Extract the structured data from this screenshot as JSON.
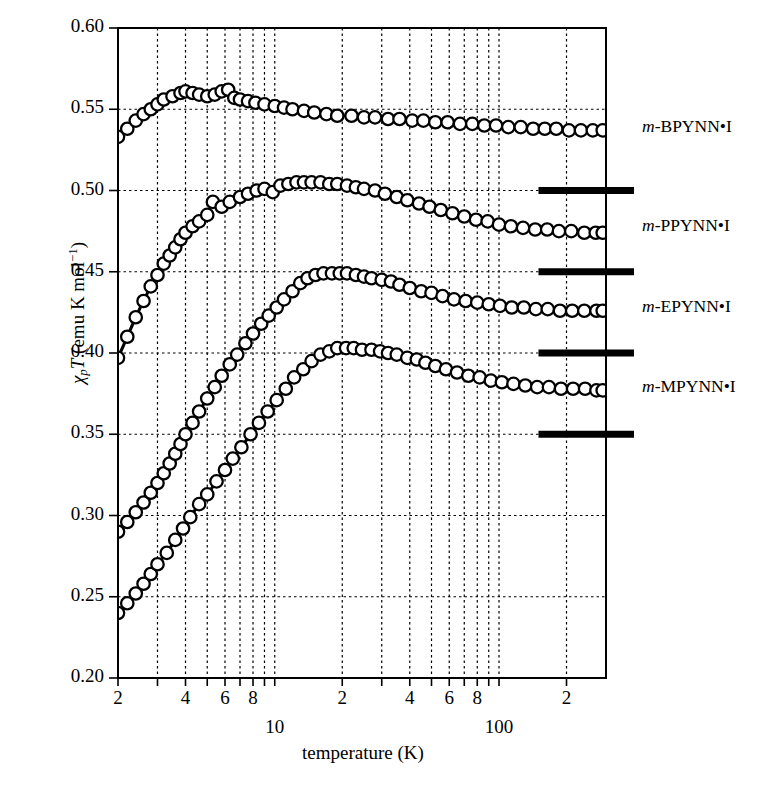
{
  "figure": {
    "background": "#ffffff",
    "ink": "#000000"
  },
  "axes": {
    "x": {
      "title": "temperature (K)",
      "scale": "log",
      "min": 2,
      "max": 300,
      "major_decade_labels": [
        {
          "value": 10,
          "text": "10"
        },
        {
          "value": 100,
          "text": "100"
        }
      ],
      "tick_labels": [
        {
          "value": 2,
          "text": "2"
        },
        {
          "value": 4,
          "text": "4"
        },
        {
          "value": 6,
          "text": "6"
        },
        {
          "value": 8,
          "text": "8"
        },
        {
          "value": 20,
          "text": "2"
        },
        {
          "value": 40,
          "text": "4"
        },
        {
          "value": 60,
          "text": "6"
        },
        {
          "value": 80,
          "text": "8"
        },
        {
          "value": 200,
          "text": "2"
        }
      ],
      "gridlines": [
        3,
        4,
        5,
        6,
        7,
        8,
        9,
        10,
        20,
        30,
        40,
        50,
        60,
        70,
        80,
        90,
        100,
        200
      ],
      "grid": true
    },
    "y": {
      "title_plain": "χpT (emu K mol⁻¹)",
      "title_parts": {
        "chi": "χ",
        "sub": "p",
        "T": "T",
        "unit_open": " (emu K mol",
        "unit_exp": "−1",
        "unit_close": ")"
      },
      "scale": "linear",
      "min": 0.2,
      "max": 0.6,
      "tick_labels": [
        "0.60",
        "0.55",
        "0.50",
        "0.45",
        "0.40",
        "0.35",
        "0.30",
        "0.25",
        "0.20"
      ],
      "tick_values": [
        0.6,
        0.55,
        0.5,
        0.45,
        0.4,
        0.35,
        0.3,
        0.25,
        0.2
      ],
      "gridlines": [
        0.55,
        0.5,
        0.45,
        0.4,
        0.35,
        0.3,
        0.25
      ],
      "grid": true
    }
  },
  "series_labels": [
    {
      "prefix": "m",
      "name": "-BPYNN•I"
    },
    {
      "prefix": "m",
      "name": "-PPYNN•I"
    },
    {
      "prefix": "m",
      "name": "-EPYNN•I"
    },
    {
      "prefix": "m",
      "name": "-MPYNN•I"
    }
  ],
  "reference_bars": [
    {
      "value": 0.5,
      "label": "0.50"
    },
    {
      "value": 0.45,
      "label": "0.45"
    },
    {
      "value": 0.4,
      "label": "0.40"
    },
    {
      "value": 0.35,
      "label": "0.35"
    }
  ],
  "chart_data": {
    "type": "scatter",
    "title": "",
    "xlabel": "temperature (K)",
    "ylabel": "χpT (emu K mol⁻¹)",
    "xscale": "log",
    "xlim": [
      2,
      300
    ],
    "ylim": [
      0.2,
      0.6
    ],
    "grid": true,
    "legend": "right-side inline annotations",
    "marker": "open-circle",
    "series": [
      {
        "name": "m-BPYNN•I",
        "peak": {
          "T": 4.0,
          "value": 0.561
        },
        "points": [
          [
            2.0,
            0.533
          ],
          [
            2.2,
            0.538
          ],
          [
            2.4,
            0.543
          ],
          [
            2.6,
            0.547
          ],
          [
            2.8,
            0.55
          ],
          [
            3.0,
            0.553
          ],
          [
            3.2,
            0.556
          ],
          [
            3.5,
            0.558
          ],
          [
            3.8,
            0.56
          ],
          [
            4.0,
            0.561
          ],
          [
            4.3,
            0.56
          ],
          [
            4.6,
            0.559
          ],
          [
            5.0,
            0.558
          ],
          [
            5.4,
            0.559
          ],
          [
            5.8,
            0.561
          ],
          [
            6.2,
            0.562
          ],
          [
            6.6,
            0.557
          ],
          [
            7.0,
            0.556
          ],
          [
            7.6,
            0.555
          ],
          [
            8.2,
            0.554
          ],
          [
            9.0,
            0.553
          ],
          [
            10.0,
            0.552
          ],
          [
            11.0,
            0.551
          ],
          [
            12.0,
            0.55
          ],
          [
            13.5,
            0.549
          ],
          [
            15.0,
            0.548
          ],
          [
            17.0,
            0.547
          ],
          [
            19.0,
            0.546
          ],
          [
            22.0,
            0.546
          ],
          [
            25.0,
            0.545
          ],
          [
            28.0,
            0.545
          ],
          [
            32.0,
            0.544
          ],
          [
            36.0,
            0.544
          ],
          [
            41.0,
            0.543
          ],
          [
            46.0,
            0.543
          ],
          [
            52.0,
            0.542
          ],
          [
            59.0,
            0.542
          ],
          [
            67.0,
            0.541
          ],
          [
            76.0,
            0.541
          ],
          [
            86.0,
            0.54
          ],
          [
            97.0,
            0.54
          ],
          [
            110.0,
            0.539
          ],
          [
            125.0,
            0.539
          ],
          [
            142.0,
            0.538
          ],
          [
            160.0,
            0.538
          ],
          [
            180.0,
            0.538
          ],
          [
            205.0,
            0.537
          ],
          [
            232.0,
            0.537
          ],
          [
            262.0,
            0.537
          ],
          [
            290.0,
            0.537
          ]
        ],
        "fit_line": true
      },
      {
        "name": "m-PPYNN•I",
        "peak": {
          "T": 13.0,
          "value": 0.505
        },
        "points": [
          [
            2.0,
            0.397
          ],
          [
            2.2,
            0.41
          ],
          [
            2.4,
            0.422
          ],
          [
            2.6,
            0.432
          ],
          [
            2.8,
            0.441
          ],
          [
            3.0,
            0.448
          ],
          [
            3.2,
            0.455
          ],
          [
            3.4,
            0.46
          ],
          [
            3.6,
            0.465
          ],
          [
            3.8,
            0.47
          ],
          [
            4.0,
            0.474
          ],
          [
            4.3,
            0.478
          ],
          [
            4.6,
            0.481
          ],
          [
            5.0,
            0.485
          ],
          [
            5.3,
            0.493
          ],
          [
            5.8,
            0.49
          ],
          [
            6.3,
            0.493
          ],
          [
            7.0,
            0.496
          ],
          [
            7.6,
            0.498
          ],
          [
            8.3,
            0.5
          ],
          [
            9.0,
            0.501
          ],
          [
            9.8,
            0.499
          ],
          [
            10.6,
            0.503
          ],
          [
            11.5,
            0.504
          ],
          [
            12.5,
            0.505
          ],
          [
            13.5,
            0.505
          ],
          [
            14.6,
            0.505
          ],
          [
            16.0,
            0.505
          ],
          [
            17.5,
            0.504
          ],
          [
            19.0,
            0.504
          ],
          [
            21.0,
            0.503
          ],
          [
            23.0,
            0.502
          ],
          [
            25.0,
            0.501
          ],
          [
            28.0,
            0.5
          ],
          [
            31.0,
            0.498
          ],
          [
            35.0,
            0.496
          ],
          [
            39.0,
            0.494
          ],
          [
            44.0,
            0.492
          ],
          [
            49.0,
            0.49
          ],
          [
            55.0,
            0.488
          ],
          [
            62.0,
            0.486
          ],
          [
            70.0,
            0.484
          ],
          [
            79.0,
            0.482
          ],
          [
            89.0,
            0.481
          ],
          [
            100.0,
            0.479
          ],
          [
            113.0,
            0.478
          ],
          [
            128.0,
            0.477
          ],
          [
            145.0,
            0.476
          ],
          [
            164.0,
            0.476
          ],
          [
            185.0,
            0.475
          ],
          [
            210.0,
            0.475
          ],
          [
            240.0,
            0.474
          ],
          [
            270.0,
            0.474
          ],
          [
            290.0,
            0.474
          ]
        ],
        "fit_line": true
      },
      {
        "name": "m-EPYNN•I",
        "peak": {
          "T": 14.0,
          "value": 0.449
        },
        "points": [
          [
            2.0,
            0.29
          ],
          [
            2.2,
            0.296
          ],
          [
            2.4,
            0.302
          ],
          [
            2.6,
            0.308
          ],
          [
            2.8,
            0.314
          ],
          [
            3.0,
            0.32
          ],
          [
            3.2,
            0.326
          ],
          [
            3.4,
            0.332
          ],
          [
            3.6,
            0.338
          ],
          [
            3.8,
            0.344
          ],
          [
            4.0,
            0.35
          ],
          [
            4.3,
            0.357
          ],
          [
            4.6,
            0.364
          ],
          [
            5.0,
            0.372
          ],
          [
            5.4,
            0.379
          ],
          [
            5.8,
            0.386
          ],
          [
            6.3,
            0.393
          ],
          [
            6.8,
            0.399
          ],
          [
            7.4,
            0.406
          ],
          [
            8.0,
            0.412
          ],
          [
            8.7,
            0.418
          ],
          [
            9.4,
            0.423
          ],
          [
            10.2,
            0.428
          ],
          [
            11.0,
            0.433
          ],
          [
            12.0,
            0.438
          ],
          [
            13.0,
            0.443
          ],
          [
            14.0,
            0.446
          ],
          [
            15.2,
            0.448
          ],
          [
            16.5,
            0.449
          ],
          [
            18.0,
            0.449
          ],
          [
            19.5,
            0.449
          ],
          [
            21.0,
            0.449
          ],
          [
            23.0,
            0.448
          ],
          [
            25.0,
            0.447
          ],
          [
            27.0,
            0.446
          ],
          [
            30.0,
            0.445
          ],
          [
            33.0,
            0.444
          ],
          [
            36.0,
            0.442
          ],
          [
            40.0,
            0.44
          ],
          [
            45.0,
            0.438
          ],
          [
            50.0,
            0.437
          ],
          [
            56.0,
            0.435
          ],
          [
            63.0,
            0.433
          ],
          [
            71.0,
            0.432
          ],
          [
            80.0,
            0.431
          ],
          [
            90.0,
            0.43
          ],
          [
            101.0,
            0.429
          ],
          [
            114.0,
            0.428
          ],
          [
            129.0,
            0.428
          ],
          [
            146.0,
            0.427
          ],
          [
            165.0,
            0.427
          ],
          [
            187.0,
            0.426
          ],
          [
            212.0,
            0.426
          ],
          [
            240.0,
            0.426
          ],
          [
            272.0,
            0.426
          ],
          [
            290.0,
            0.426
          ]
        ],
        "fit_line": true
      },
      {
        "name": "m-MPYNN•I",
        "peak": {
          "T": 19.0,
          "value": 0.403
        },
        "points": [
          [
            2.0,
            0.24
          ],
          [
            2.2,
            0.246
          ],
          [
            2.4,
            0.252
          ],
          [
            2.6,
            0.258
          ],
          [
            2.8,
            0.264
          ],
          [
            3.0,
            0.27
          ],
          [
            3.3,
            0.277
          ],
          [
            3.6,
            0.285
          ],
          [
            3.9,
            0.292
          ],
          [
            4.2,
            0.299
          ],
          [
            4.6,
            0.307
          ],
          [
            5.0,
            0.313
          ],
          [
            5.5,
            0.321
          ],
          [
            6.0,
            0.328
          ],
          [
            6.5,
            0.335
          ],
          [
            7.1,
            0.342
          ],
          [
            7.8,
            0.35
          ],
          [
            8.5,
            0.357
          ],
          [
            9.3,
            0.364
          ],
          [
            10.2,
            0.371
          ],
          [
            11.2,
            0.378
          ],
          [
            12.2,
            0.385
          ],
          [
            13.4,
            0.39
          ],
          [
            14.6,
            0.395
          ],
          [
            16.0,
            0.399
          ],
          [
            17.5,
            0.401
          ],
          [
            19.0,
            0.403
          ],
          [
            20.8,
            0.403
          ],
          [
            22.5,
            0.403
          ],
          [
            24.5,
            0.402
          ],
          [
            27.0,
            0.402
          ],
          [
            29.5,
            0.401
          ],
          [
            32.0,
            0.4
          ],
          [
            35.0,
            0.399
          ],
          [
            39.0,
            0.397
          ],
          [
            43.0,
            0.396
          ],
          [
            47.0,
            0.394
          ],
          [
            52.0,
            0.392
          ],
          [
            58.0,
            0.39
          ],
          [
            65.0,
            0.388
          ],
          [
            73.0,
            0.386
          ],
          [
            82.0,
            0.385
          ],
          [
            92.0,
            0.383
          ],
          [
            103.0,
            0.382
          ],
          [
            116.0,
            0.381
          ],
          [
            131.0,
            0.38
          ],
          [
            148.0,
            0.379
          ],
          [
            167.0,
            0.379
          ],
          [
            189.0,
            0.378
          ],
          [
            214.0,
            0.378
          ],
          [
            242.0,
            0.378
          ],
          [
            272.0,
            0.377
          ],
          [
            290.0,
            0.377
          ]
        ],
        "fit_line": true
      }
    ]
  }
}
